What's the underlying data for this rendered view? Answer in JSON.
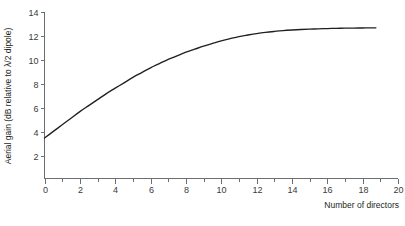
{
  "chart_data": {
    "type": "line",
    "title": "",
    "xlabel": "Number of directors",
    "ylabel": "Aerial gain (dB relative to λ/2 dipole)",
    "xlim": [
      0,
      20
    ],
    "ylim": [
      0,
      14
    ],
    "grid": false,
    "legend": null,
    "x_ticks": [
      0,
      2,
      4,
      6,
      8,
      10,
      12,
      14,
      16,
      18,
      20
    ],
    "x_tick_labels": [
      "0",
      "2",
      "4",
      "6",
      "8",
      "10",
      "12",
      "14",
      "16",
      "18",
      "20"
    ],
    "x_minor_ticks": [
      1,
      3,
      5,
      7,
      9,
      11,
      13,
      15,
      17,
      19
    ],
    "y_ticks": [
      2,
      4,
      6,
      8,
      10,
      12,
      14
    ],
    "y_tick_labels": [
      "2",
      "4",
      "6",
      "8",
      "10",
      "12",
      "14"
    ],
    "y_minor_ticks": [],
    "series": [
      {
        "name": "Aerial gain",
        "x": [
          0,
          0.5,
          1,
          1.5,
          2,
          2.5,
          3,
          3.5,
          4,
          4.5,
          5,
          5.5,
          6,
          6.5,
          7,
          7.5,
          8,
          8.5,
          9,
          9.5,
          10,
          10.5,
          11,
          11.5,
          12,
          12.5,
          13,
          13.5,
          14,
          14.5,
          15,
          15.5,
          16,
          16.5,
          17,
          17.5,
          18,
          18.5,
          18.75
        ],
        "y": [
          3.5,
          4.05,
          4.6,
          5.15,
          5.7,
          6.2,
          6.7,
          7.2,
          7.65,
          8.1,
          8.55,
          8.95,
          9.35,
          9.7,
          10.05,
          10.35,
          10.65,
          10.9,
          11.15,
          11.38,
          11.6,
          11.78,
          11.95,
          12.08,
          12.2,
          12.3,
          12.38,
          12.45,
          12.5,
          12.54,
          12.57,
          12.6,
          12.62,
          12.64,
          12.65,
          12.66,
          12.67,
          12.68,
          12.68
        ]
      }
    ]
  },
  "axis": {
    "x_title": "Number of directors",
    "y_title": "Aerial gain (dB relative to λ/2 dipole)"
  },
  "colors": {
    "curve": "#231f20",
    "axis": "#6d6e71",
    "tick_text": "#3a3a3a",
    "background": "#ffffff"
  }
}
